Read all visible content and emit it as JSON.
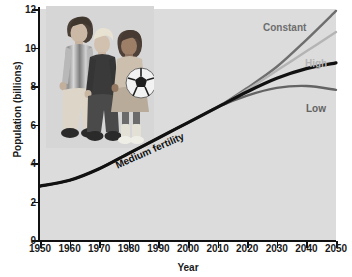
{
  "chart_data": {
    "type": "line",
    "title": "",
    "xlabel": "Year",
    "ylabel": "Population (billions)",
    "xlim": [
      1950,
      2050
    ],
    "ylim": [
      0,
      12
    ],
    "xticks": [
      1950,
      1960,
      1970,
      1980,
      1990,
      2000,
      2010,
      2020,
      2030,
      2040,
      2050
    ],
    "yticks": [
      0,
      2,
      4,
      6,
      8,
      10,
      12
    ],
    "grid": false,
    "legend_position": "inline-end-of-line",
    "x": [
      1950,
      1960,
      1970,
      1980,
      1990,
      2000,
      2010,
      2020,
      2030,
      2040,
      2050
    ],
    "series": [
      {
        "name": "Medium fertility",
        "label": "Medium fertility",
        "color": "#111111",
        "values": [
          2.8,
          3.1,
          3.7,
          4.5,
          5.3,
          6.1,
          6.9,
          7.7,
          8.4,
          8.9,
          9.2
        ]
      },
      {
        "name": "Constant",
        "label": "Constant",
        "color": "#6e6e6e",
        "values": [
          2.8,
          3.1,
          3.7,
          4.5,
          5.3,
          6.1,
          6.9,
          7.9,
          9.0,
          10.4,
          11.9
        ]
      },
      {
        "name": "High",
        "label": "High",
        "color": "#b4b4b4",
        "values": [
          2.8,
          3.1,
          3.7,
          4.5,
          5.3,
          6.1,
          6.9,
          7.8,
          8.8,
          9.8,
          10.8
        ]
      },
      {
        "name": "Low",
        "label": "Low",
        "color": "#636363",
        "values": [
          2.8,
          3.1,
          3.7,
          4.5,
          5.3,
          6.1,
          6.9,
          7.5,
          7.9,
          8.0,
          7.8
        ]
      }
    ]
  },
  "axes": {
    "ylabel": "Population (billions)",
    "xlabel": "Year",
    "yticks": [
      "12",
      "10",
      "8",
      "6",
      "4",
      "2",
      "0"
    ],
    "xticks": [
      "1950",
      "1960",
      "1970",
      "1980",
      "1990",
      "2000",
      "2010",
      "2020",
      "2030",
      "2040",
      "2050"
    ]
  },
  "labels": {
    "constant": "Constant",
    "high": "High",
    "low": "Low",
    "medium": "Medium fertility"
  },
  "photo": {
    "alt": "three children standing together, one holding a soccer ball"
  },
  "colors": {
    "plot_background": "#dcdcdc",
    "page_background": "#ffffff",
    "axis": "#111111",
    "medium": "#111111",
    "constant": "#6e6e6e",
    "high": "#b4b4b4",
    "low": "#636363"
  }
}
